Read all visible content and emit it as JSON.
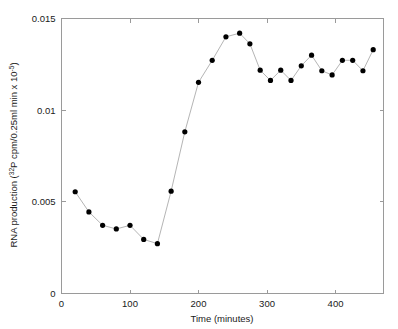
{
  "chart_data": {
    "type": "line",
    "title": "",
    "xlabel": "Time (minutes)",
    "ylabel": "RNA production (",
    "ylabel_sup1": "32",
    "ylabel_mid": "P cpm/0.25ml min x 10",
    "ylabel_sup2": "-5",
    "ylabel_end": ")",
    "ylabel_full": "RNA production (32P cpm/0.25ml min x 10-5)",
    "xlim": [
      0,
      470
    ],
    "ylim": [
      0,
      0.015
    ],
    "xticks": [
      0,
      100,
      200,
      300,
      400
    ],
    "yticks": [
      0,
      0.005,
      0.01,
      0.015
    ],
    "xtick_labels": [
      "0",
      "100",
      "200",
      "300",
      "400"
    ],
    "ytick_labels": [
      "0",
      "0.005",
      "0.01",
      "0.015"
    ],
    "grid": false,
    "legend": "none",
    "marker": "filled-circle",
    "marker_color": "#000000",
    "line_color": "#b5b5b5",
    "x": [
      20,
      40,
      60,
      80,
      100,
      120,
      140,
      160,
      180,
      200,
      220,
      240,
      260,
      275,
      290,
      305,
      320,
      335,
      350,
      365,
      380,
      395,
      410,
      425,
      440,
      455
    ],
    "values": [
      0.00555,
      0.00445,
      0.00372,
      0.00352,
      0.00372,
      0.00295,
      0.00272,
      0.00558,
      0.00882,
      0.01152,
      0.01272,
      0.014,
      0.0142,
      0.01362,
      0.01218,
      0.01162,
      0.01218,
      0.01162,
      0.01242,
      0.013,
      0.01215,
      0.01192,
      0.01272,
      0.01272,
      0.01215,
      0.0133
    ],
    "series": [
      {
        "name": "RNA production",
        "points": [
          {
            "x": 20,
            "y": 0.00555
          },
          {
            "x": 40,
            "y": 0.00445
          },
          {
            "x": 60,
            "y": 0.00372
          },
          {
            "x": 80,
            "y": 0.00352
          },
          {
            "x": 100,
            "y": 0.00372
          },
          {
            "x": 120,
            "y": 0.00295
          },
          {
            "x": 140,
            "y": 0.00272
          },
          {
            "x": 160,
            "y": 0.00558
          },
          {
            "x": 180,
            "y": 0.00882
          },
          {
            "x": 200,
            "y": 0.01152
          },
          {
            "x": 220,
            "y": 0.01272
          },
          {
            "x": 240,
            "y": 0.014
          },
          {
            "x": 260,
            "y": 0.0142
          },
          {
            "x": 275,
            "y": 0.01362
          },
          {
            "x": 290,
            "y": 0.01218
          },
          {
            "x": 305,
            "y": 0.01162
          },
          {
            "x": 320,
            "y": 0.01218
          },
          {
            "x": 335,
            "y": 0.01162
          },
          {
            "x": 350,
            "y": 0.01242
          },
          {
            "x": 365,
            "y": 0.013
          },
          {
            "x": 380,
            "y": 0.01215
          },
          {
            "x": 395,
            "y": 0.01192
          },
          {
            "x": 410,
            "y": 0.01272
          },
          {
            "x": 425,
            "y": 0.01272
          },
          {
            "x": 440,
            "y": 0.01215
          },
          {
            "x": 455,
            "y": 0.0133
          }
        ]
      }
    ]
  }
}
